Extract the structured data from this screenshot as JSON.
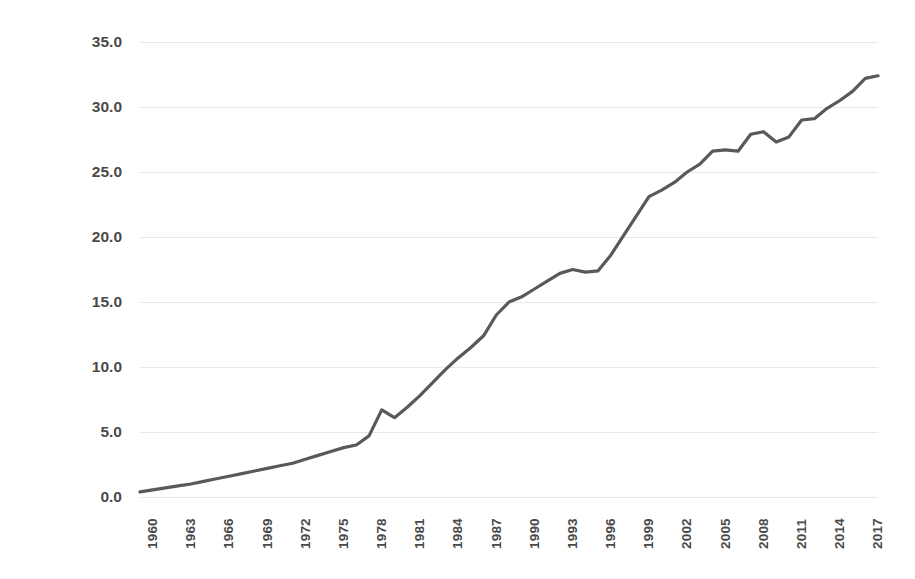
{
  "chart_data": {
    "type": "line",
    "title": "",
    "subtitle": "",
    "xlabel": "",
    "ylabel": "Plastic Waste (MMT)",
    "ylim": [
      0.0,
      35.0
    ],
    "xlim": [
      1960,
      2018
    ],
    "grid": true,
    "legend": null,
    "line_color": "#595959",
    "line_width": 3.2,
    "y_ticks": [
      "0.0",
      "5.0",
      "10.0",
      "15.0",
      "20.0",
      "25.0",
      "30.0",
      "35.0"
    ],
    "y_tick_values": [
      0.0,
      5.0,
      10.0,
      15.0,
      20.0,
      25.0,
      30.0,
      35.0
    ],
    "x_ticks": [
      "1960",
      "1963",
      "1966",
      "1969",
      "1972",
      "1975",
      "1978",
      "1981",
      "1984",
      "1987",
      "1990",
      "1993",
      "1996",
      "1999",
      "2002",
      "2005",
      "2008",
      "2011",
      "2014",
      "2017"
    ],
    "x_tick_values": [
      1960,
      1963,
      1966,
      1969,
      1972,
      1975,
      1978,
      1981,
      1984,
      1987,
      1990,
      1993,
      1996,
      1999,
      2002,
      2005,
      2008,
      2011,
      2014,
      2017
    ],
    "x": [
      1960,
      1961,
      1962,
      1963,
      1964,
      1965,
      1966,
      1967,
      1968,
      1969,
      1970,
      1971,
      1972,
      1973,
      1974,
      1975,
      1976,
      1977,
      1978,
      1979,
      1980,
      1981,
      1982,
      1983,
      1984,
      1985,
      1986,
      1987,
      1988,
      1989,
      1990,
      1991,
      1992,
      1993,
      1994,
      1995,
      1996,
      1997,
      1998,
      1999,
      2000,
      2001,
      2002,
      2003,
      2004,
      2005,
      2006,
      2007,
      2008,
      2009,
      2010,
      2011,
      2012,
      2013,
      2014,
      2015,
      2016,
      2017,
      2018
    ],
    "values": [
      0.39,
      0.55,
      0.7,
      0.85,
      1.0,
      1.2,
      1.4,
      1.6,
      1.8,
      2.0,
      2.2,
      2.4,
      2.6,
      2.9,
      3.2,
      3.5,
      3.8,
      4.0,
      4.7,
      6.7,
      6.1,
      6.9,
      7.8,
      8.8,
      9.8,
      10.7,
      11.5,
      12.4,
      14.0,
      15.0,
      15.4,
      16.0,
      16.6,
      17.2,
      17.5,
      17.3,
      17.4,
      18.6,
      20.1,
      21.6,
      23.1,
      23.6,
      24.2,
      25.0,
      25.6,
      26.6,
      26.7,
      26.6,
      27.9,
      28.1,
      27.3,
      27.7,
      29.0,
      29.1,
      29.9,
      30.5,
      31.2,
      32.2,
      32.4
    ]
  }
}
